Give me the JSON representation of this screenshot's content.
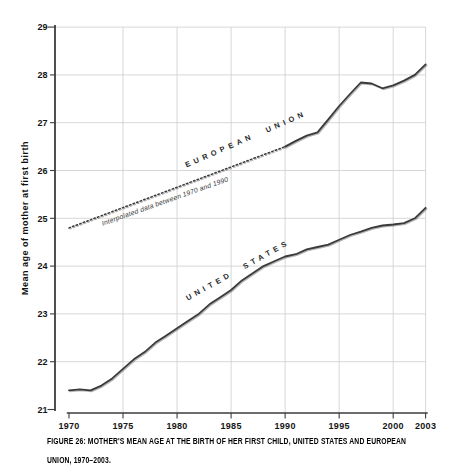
{
  "figure": {
    "caption": {
      "line1": "FIGURE 26: MOTHER'S MEAN AGE AT THE BIRTH OF HER FIRST CHILD, UNITED STATES AND EUROPEAN",
      "line2": "UNION, 1970–2003."
    }
  },
  "chart_data": {
    "type": "line",
    "title": "FIGURE 26: MOTHER'S MEAN AGE AT THE BIRTH OF HER FIRST CHILD, UNITED STATES AND EUROPEAN UNION, 1970–2003.",
    "xlabel": "",
    "ylabel": "Mean age of mother at first birth",
    "xlim": [
      1970,
      2003
    ],
    "ylim": [
      21,
      29
    ],
    "x_ticks": [
      1970,
      1975,
      1980,
      1985,
      1990,
      1995,
      2000,
      2003
    ],
    "y_ticks": [
      21,
      22,
      23,
      24,
      25,
      26,
      27,
      28,
      29
    ],
    "grid": true,
    "legend_position": "labels rotated along lines inside plot",
    "series": [
      {
        "name": "EUROPEAN UNION",
        "segment": "interpolated",
        "style": "dotted",
        "note": "Interpolated data between 1970 and 1990",
        "x": [
          1970,
          1990
        ],
        "values": [
          24.8,
          26.5
        ]
      },
      {
        "name": "EUROPEAN UNION",
        "segment": "observed",
        "style": "solid",
        "x": [
          1990,
          1991,
          1992,
          1993,
          1994,
          1995,
          1996,
          1997,
          1998,
          1999,
          2000,
          2001,
          2002,
          2003
        ],
        "values": [
          26.5,
          26.62,
          26.73,
          26.8,
          27.07,
          27.35,
          27.6,
          27.84,
          27.82,
          27.72,
          27.78,
          27.88,
          28.0,
          28.22
        ]
      },
      {
        "name": "UNITED STATES",
        "segment": "observed",
        "style": "solid",
        "x": [
          1970,
          1971,
          1972,
          1973,
          1974,
          1975,
          1976,
          1977,
          1978,
          1979,
          1980,
          1981,
          1982,
          1983,
          1984,
          1985,
          1986,
          1987,
          1988,
          1989,
          1990,
          1991,
          1992,
          1993,
          1994,
          1995,
          1996,
          1997,
          1998,
          1999,
          2000,
          2001,
          2002,
          2003
        ],
        "values": [
          21.4,
          21.42,
          21.4,
          21.5,
          21.65,
          21.85,
          22.05,
          22.2,
          22.4,
          22.55,
          22.7,
          22.85,
          23.0,
          23.2,
          23.35,
          23.5,
          23.7,
          23.85,
          24.0,
          24.1,
          24.2,
          24.25,
          24.35,
          24.4,
          24.45,
          24.55,
          24.65,
          24.72,
          24.8,
          24.85,
          24.87,
          24.9,
          25.0,
          25.22
        ]
      }
    ]
  }
}
